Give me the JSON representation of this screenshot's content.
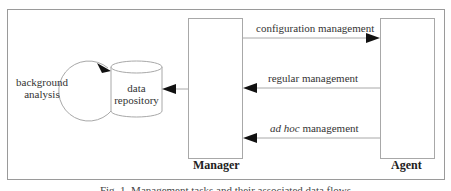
{
  "diagram": {
    "nodes": {
      "manager": {
        "label": "Manager"
      },
      "agent": {
        "label": "Agent"
      },
      "repository": {
        "line1": "data",
        "line2": "repository"
      },
      "background": {
        "line1": "background",
        "line2": "analysis"
      }
    },
    "edges": {
      "configuration": {
        "label": "configuration management",
        "from": "Manager",
        "to": "Agent"
      },
      "regular": {
        "label": "regular management",
        "from": "Agent",
        "to": "Manager"
      },
      "adhoc": {
        "italic": "ad hoc",
        "rest": " management",
        "from": "Agent",
        "to": "Manager"
      },
      "store": {
        "from": "Manager",
        "to": "data repository"
      },
      "loop": {
        "from": "background analysis",
        "to": "data repository"
      }
    },
    "caption": "Fig. 1. Management tasks and their associated data flows"
  },
  "colors": {
    "line": "#a8a8a8",
    "arrow": "#111111",
    "frame": "#9a9a9a"
  }
}
